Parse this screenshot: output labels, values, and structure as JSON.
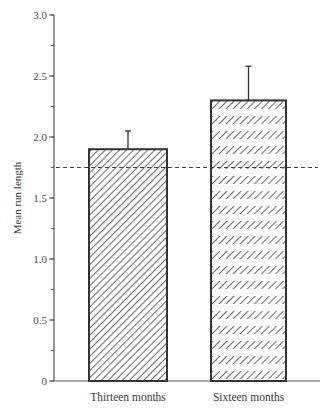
{
  "chart_data": {
    "type": "bar",
    "title": "",
    "xlabel": "",
    "ylabel": "Mean run length",
    "ylim": [
      0,
      3.0
    ],
    "yticks": [
      0,
      0.5,
      1.0,
      1.5,
      2.0,
      2.5,
      3.0
    ],
    "ytick_labels": [
      "0",
      "0.5",
      "1.0",
      "1.5",
      "2.0",
      "2.5",
      "3.0"
    ],
    "minor_tick_step": 0.25,
    "categories": [
      "Thirteen months",
      "Sixteen months"
    ],
    "values": [
      1.9,
      2.3
    ],
    "error_upper": [
      2.05,
      2.58
    ],
    "bar_patterns": [
      "diagonal-hatch",
      "banded-diagonal-hatch"
    ],
    "reference_line": {
      "value": 1.75,
      "style": "dashed"
    },
    "grid": false,
    "legend": "none",
    "colors": {
      "axis": "#555555",
      "bar_edge": "#333333",
      "hatch": "#444444",
      "reference": "#444444"
    }
  }
}
